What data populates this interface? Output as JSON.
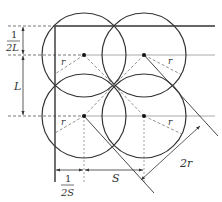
{
  "diagram": {
    "colors": {
      "stroke": "#333333",
      "gray_line": "#aaaaaa",
      "dashed": "#777777",
      "background": "#ffffff"
    },
    "labels": {
      "half_L_num": "1",
      "half_L_den": "2L",
      "L": "L",
      "half_S_num": "1",
      "half_S_den": "2S",
      "S": "S",
      "two_r": "2r",
      "r_tl": "r",
      "r_tr": "r",
      "r_bl": "r",
      "r_br": "r"
    },
    "circles": [
      {
        "name": "top-left",
        "cx": 84,
        "cy": 55,
        "r": 42
      },
      {
        "name": "top-right",
        "cx": 144,
        "cy": 55,
        "r": 42
      },
      {
        "name": "bottom-left",
        "cx": 84,
        "cy": 116,
        "r": 42
      },
      {
        "name": "bottom-right",
        "cx": 144,
        "cy": 116,
        "r": 42
      }
    ]
  }
}
